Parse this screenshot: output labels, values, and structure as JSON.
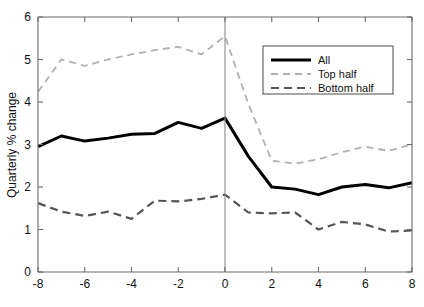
{
  "chart_data": {
    "type": "line",
    "title": "",
    "xlabel": "",
    "ylabel": "Quarterly % change",
    "xlim": [
      -8,
      8
    ],
    "ylim": [
      0,
      6
    ],
    "xticks": [
      -8,
      -6,
      -4,
      -2,
      0,
      2,
      4,
      6,
      8
    ],
    "xtick_labels": [
      "-8",
      "-6",
      "-4",
      "-2",
      "0",
      "2",
      "4",
      "6",
      "8"
    ],
    "yticks": [
      0,
      1,
      2,
      3,
      4,
      5,
      6
    ],
    "ytick_labels": [
      "0",
      "1",
      "2",
      "3",
      "4",
      "5",
      "6"
    ],
    "grid": false,
    "legend_position": "top-right",
    "x": [
      -8,
      -7,
      -6,
      -5,
      -4,
      -3,
      -2,
      -1,
      0,
      1,
      2,
      3,
      4,
      5,
      6,
      7,
      8
    ],
    "series": [
      {
        "name": "All",
        "style": "solid",
        "color": "#000000",
        "width": 3.0,
        "values": [
          2.95,
          3.2,
          3.08,
          3.15,
          3.24,
          3.26,
          3.52,
          3.38,
          3.62,
          2.72,
          2.0,
          1.95,
          1.82,
          2.0,
          2.06,
          1.98,
          2.1
        ]
      },
      {
        "name": "Top half",
        "style": "dashed",
        "color": "#b0b0b0",
        "width": 1.8,
        "values": [
          4.24,
          5.0,
          4.85,
          5.0,
          5.12,
          5.22,
          5.3,
          5.12,
          5.55,
          3.95,
          2.62,
          2.55,
          2.65,
          2.82,
          2.95,
          2.85,
          3.0
        ]
      },
      {
        "name": "Bottom half",
        "style": "dashed",
        "color": "#555555",
        "width": 2.2,
        "values": [
          1.62,
          1.42,
          1.32,
          1.42,
          1.25,
          1.68,
          1.66,
          1.72,
          1.82,
          1.4,
          1.38,
          1.4,
          1.0,
          1.18,
          1.12,
          0.95,
          0.98
        ]
      }
    ],
    "vertical_reference_line": 0
  },
  "legend": {
    "entries": [
      {
        "label": "All"
      },
      {
        "label": "Top half"
      },
      {
        "label": "Bottom half"
      }
    ]
  }
}
